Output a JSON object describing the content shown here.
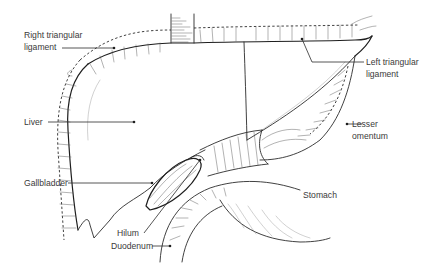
{
  "diagram": {
    "colors": {
      "background": "#ffffff",
      "ink": "#2b2b2b",
      "label_text": "#3a3a3a"
    },
    "labels": {
      "right_triangular_ligament": {
        "line1": "Right triangular",
        "line2": "ligament"
      },
      "left_triangular_ligament": {
        "line1": "Left triangular",
        "line2": "ligament"
      },
      "liver": {
        "text": "Liver"
      },
      "lesser_omentum": {
        "line1": "Lesser",
        "line2": "omentum"
      },
      "gallbladder": {
        "text": "Gallbladder"
      },
      "stomach": {
        "text": "Stomach"
      },
      "hilum": {
        "text": "Hilum"
      },
      "duodenum": {
        "text": "Duodenum"
      }
    }
  }
}
